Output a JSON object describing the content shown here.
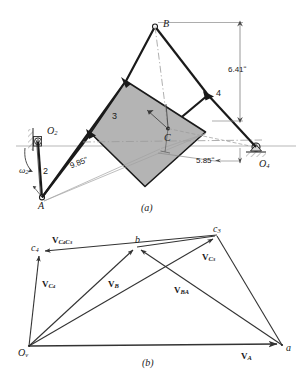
{
  "figure": {
    "title_a": "(a)",
    "title_b": "(b)",
    "colors": {
      "line": "#1a1a1a",
      "shade_fill": "#b3b3b3",
      "shade_stroke": "#1a1a1a",
      "dim_line": "#8a8a8a",
      "center_line": "#9a9a9a",
      "vector": "#333333",
      "hatch": "#707070"
    }
  },
  "mechanism": {
    "caption": "(a)",
    "points": {
      "O2": "O",
      "O2_sub": "2",
      "O4": "O",
      "O4_sub": "4",
      "A": "A",
      "B": "B",
      "C": "C"
    },
    "links": {
      "link2": "2",
      "link3": "3",
      "link4": "4"
    },
    "omega": {
      "symbol": "ω",
      "sub": "2"
    },
    "dimensions": [
      {
        "name": "dim-641",
        "label": "6.41ʺ",
        "value": 6.41,
        "unit": "in"
      },
      {
        "name": "dim-985",
        "label": "9.85ʺ",
        "value": 9.85,
        "unit": "in"
      },
      {
        "name": "dim-585",
        "label": "5.85ʺ",
        "value": 5.85,
        "unit": "in"
      }
    ]
  },
  "velocity_polygon": {
    "caption": "(b)",
    "points": {
      "Ov": "O",
      "Ov_sub": "v",
      "a": "a",
      "b": "b",
      "c3": "c",
      "c3_sub": "3",
      "c4": "c",
      "c4_sub": "4"
    },
    "vectors": [
      {
        "name": "V_A",
        "bold": "V",
        "sub": "A",
        "from": "Ov",
        "to": "a"
      },
      {
        "name": "V_B",
        "bold": "V",
        "sub": "B",
        "from": "Ov",
        "to": "b"
      },
      {
        "name": "V_BA",
        "bold": "V",
        "sub": "BA",
        "from": "a",
        "to": "b"
      },
      {
        "name": "V_C3",
        "bold": "V",
        "sub": "C3",
        "from": "Ov",
        "to": "c3"
      },
      {
        "name": "V_C4",
        "bold": "V",
        "sub": "C4",
        "from": "Ov",
        "to": "c4"
      },
      {
        "name": "V_C4C3",
        "bold": "V",
        "sub": "C4C3",
        "from": "c3",
        "to": "c4"
      }
    ],
    "labels": {
      "V_A_main": "V",
      "V_A_sub": "A",
      "V_B_main": "V",
      "V_B_sub": "B",
      "V_BA_main": "V",
      "V_BA_sub": "BA",
      "V_C3_main": "V",
      "V_C3_sub": "C",
      "V_C3_subsub": "3",
      "V_C4_main": "V",
      "V_C4_sub": "C",
      "V_C4_subsub": "4",
      "V_C4C3_main": "V",
      "V_C4C3_sub1": "C",
      "V_C4C3_subsub1": "4",
      "V_C4C3_sub2": "C",
      "V_C4C3_subsub2": "3"
    }
  }
}
